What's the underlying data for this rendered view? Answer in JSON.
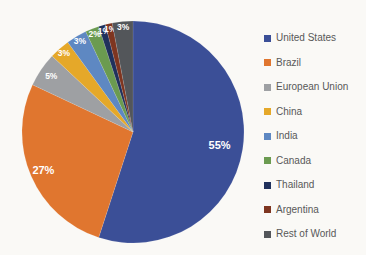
{
  "canvas": {
    "background_color": "#FAF9F6",
    "data_label_color": "#FFFFFF",
    "legend_text_color": "#585858"
  },
  "chart_data": {
    "type": "pie",
    "title": "",
    "categories": [
      "United States",
      "Brazil",
      "European Union",
      "China",
      "India",
      "Canada",
      "Thailand",
      "Argentina",
      "Rest of World"
    ],
    "values": [
      55,
      27,
      5,
      3,
      3,
      2,
      1,
      1,
      3
    ],
    "data_labels": [
      "55%",
      "27%",
      "5%",
      "3%",
      "3%",
      "2%",
      "1%",
      "1%",
      "3%"
    ],
    "colors": [
      "#3B4F97",
      "#E0762F",
      "#9EA0A3",
      "#E5A829",
      "#5E88C2",
      "#6B9B50",
      "#20315C",
      "#7E3520",
      "#53565A"
    ],
    "start_angle_deg": 0,
    "direction": "clockwise",
    "legend_position": "right",
    "grid": false
  }
}
